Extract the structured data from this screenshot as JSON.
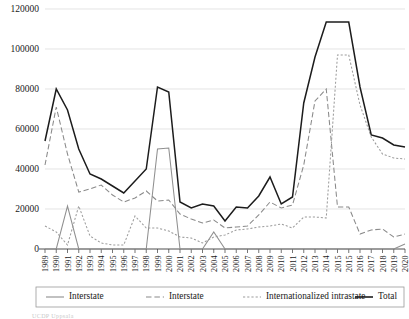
{
  "chart_data": {
    "type": "line",
    "title": "",
    "subtitle": "",
    "xlabel": "",
    "ylabel": "",
    "ylim": [
      0,
      120000
    ],
    "ytick_labels": [
      "0",
      "20000",
      "40000",
      "60000",
      "80000",
      "100000",
      "120000"
    ],
    "ytick_values": [
      0,
      20000,
      40000,
      60000,
      80000,
      100000,
      120000
    ],
    "grid": true,
    "legend_position": "bottom",
    "categories": [
      "1989",
      "1990",
      "1991",
      "1992",
      "1993",
      "1994",
      "1995",
      "1996",
      "1997",
      "1998",
      "1999",
      "2000",
      "2001",
      "2002",
      "2003",
      "2004",
      "2005",
      "2006",
      "2007",
      "2008",
      "2009",
      "2010",
      "2011",
      "2012",
      "2013",
      "2014",
      "2015",
      "2015",
      "2016",
      "2017",
      "2018",
      "2019",
      "2020"
    ],
    "series": [
      {
        "name": "Interstate",
        "color": "#8f8f8f",
        "style": "solid",
        "values": [
          0,
          0,
          21500,
          0,
          0,
          0,
          0,
          0,
          0,
          0,
          50000,
          50500,
          0,
          0,
          0,
          8500,
          0,
          0,
          0,
          0,
          0,
          0,
          0,
          0,
          0,
          0,
          0,
          0,
          0,
          0,
          0,
          0,
          2500
        ]
      },
      {
        "name": "Interstate",
        "color": "#8a8a8a",
        "style": "long-dash",
        "values": [
          42000,
          71000,
          47500,
          28500,
          30000,
          32000,
          27000,
          23500,
          25500,
          29000,
          24000,
          24500,
          17500,
          15000,
          13000,
          14500,
          10500,
          11000,
          11500,
          17000,
          23500,
          20500,
          22000,
          42000,
          74000,
          80000,
          21000,
          21000,
          7500,
          9500,
          10000,
          6000,
          7500
        ]
      },
      {
        "name": "Internationalized intrastate",
        "color": "#9c9c9c",
        "style": "short-dash",
        "values": [
          11500,
          8500,
          2000,
          21500,
          6500,
          3000,
          2000,
          2000,
          16500,
          10500,
          10500,
          9000,
          6000,
          5500,
          3000,
          6000,
          7000,
          9500,
          10000,
          11000,
          11500,
          12500,
          10500,
          16000,
          16000,
          15500,
          97000,
          97000,
          72000,
          56000,
          47500,
          45500,
          45000
        ]
      },
      {
        "name": "Total",
        "color": "#1c1c1c",
        "style": "solid",
        "values": [
          54000,
          80000,
          69500,
          50000,
          37500,
          35000,
          31500,
          28000,
          34000,
          40000,
          81000,
          78500,
          23500,
          20500,
          22500,
          21500,
          14000,
          21000,
          20500,
          26500,
          36000,
          22500,
          26000,
          73000,
          96000,
          113500,
          113500,
          113500,
          81000,
          57000,
          55500,
          52000,
          51000
        ]
      }
    ],
    "legend_entries": [
      {
        "label": "Interstate",
        "color": "#8f8f8f",
        "style": "solid"
      },
      {
        "label": "Interstate",
        "color": "#8a8a8a",
        "style": "long-dash"
      },
      {
        "label": "Internationalized intrastate",
        "color": "#9c9c9c",
        "style": "short-dash"
      },
      {
        "label": "Total",
        "color": "#1c1c1c",
        "style": "solid"
      }
    ]
  },
  "footnote": {
    "text": "UCDP Uppsala"
  }
}
